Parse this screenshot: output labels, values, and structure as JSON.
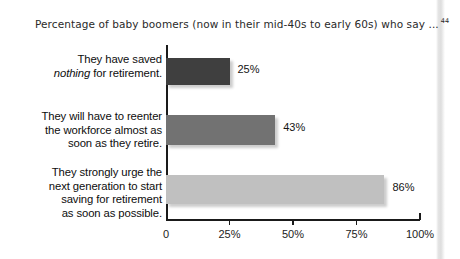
{
  "chart_data": {
    "type": "bar",
    "orientation": "horizontal",
    "title": "Percentage of baby boomers (now in their mid-40s to early 60s) who say ...",
    "title_footnote": "44",
    "xlabel": "",
    "ylabel": "",
    "xlim": [
      0,
      100
    ],
    "grid": false,
    "legend": false,
    "categories": [
      "They have saved nothing for retirement.",
      "They will have to reenter the workforce almost as soon as they retire.",
      "They strongly urge the next generation to start saving for retirement as soon as possible."
    ],
    "values": [
      25,
      43,
      86
    ],
    "value_labels": [
      "25%",
      "43%",
      "86%"
    ],
    "bar_colors": [
      "#3f3f3f",
      "#727272",
      "#c0c0c0"
    ],
    "xticks": [
      0,
      25,
      50,
      75,
      100
    ],
    "xtick_labels": [
      "0",
      "25%",
      "50%",
      "75%",
      "100%"
    ]
  },
  "bars": [
    {
      "label_lines": [
        "They have saved",
        "nothing for retirement."
      ],
      "italic_word": "nothing",
      "value": 25,
      "value_label": "25%",
      "color": "#3f3f3f"
    },
    {
      "label_lines": [
        "They will have to reenter",
        "the workforce almost as",
        "soon as they retire."
      ],
      "italic_word": "",
      "value": 43,
      "value_label": "43%",
      "color": "#727272"
    },
    {
      "label_lines": [
        "They strongly urge the",
        "next generation to start",
        "saving for retirement",
        "as soon as possible."
      ],
      "italic_word": "",
      "value": 86,
      "value_label": "86%",
      "color": "#c0c0c0"
    }
  ],
  "axis": {
    "tick_labels": [
      "0",
      "25%",
      "50%",
      "75%",
      "100%"
    ]
  },
  "colors": {
    "background": "#ffffff",
    "axis": "#1a1a1a",
    "text": "#0d0d0d",
    "title_text": "#2a2a2a"
  }
}
